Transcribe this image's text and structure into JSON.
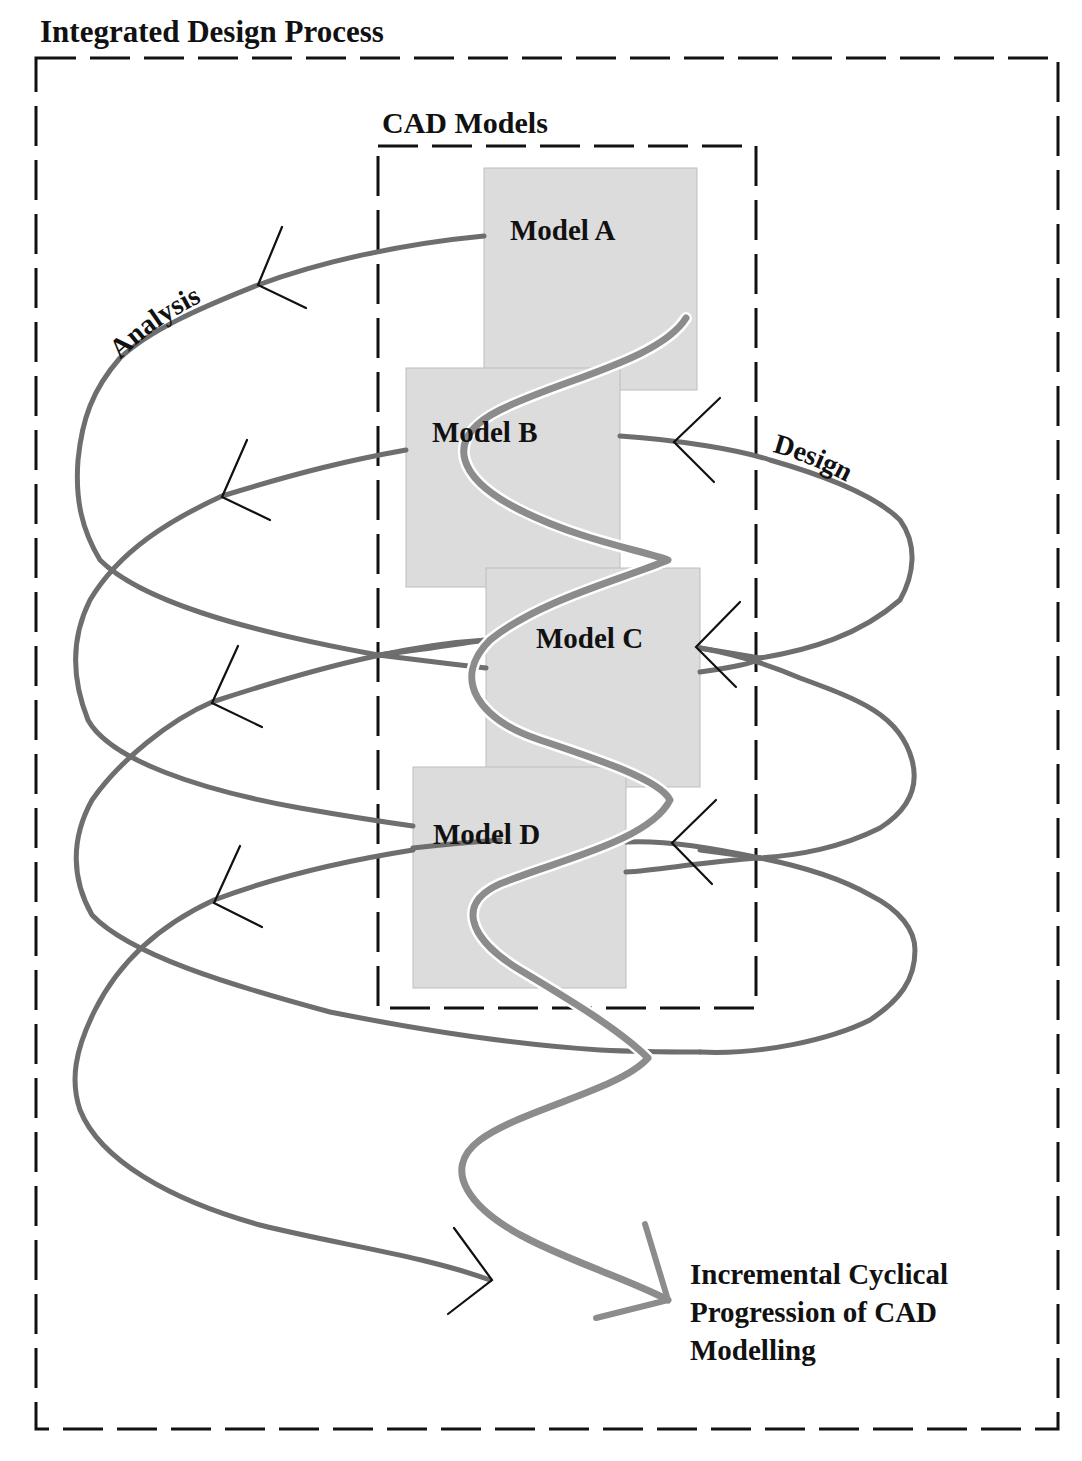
{
  "diagram": {
    "outer_frame": {
      "title": "Integrated Design Process",
      "style": "dashed"
    },
    "inner_frame": {
      "title": "CAD Models",
      "style": "dashed"
    },
    "models": [
      {
        "id": "A",
        "label": "Model A"
      },
      {
        "id": "B",
        "label": "Model B"
      },
      {
        "id": "C",
        "label": "Model C"
      },
      {
        "id": "D",
        "label": "Model D"
      }
    ],
    "spiral_labels": {
      "left": "Analysis",
      "right": "Design"
    },
    "caption": {
      "lines": [
        "Incremental Cyclical",
        "Progression of CAD",
        "Modelling"
      ]
    },
    "colors": {
      "frame": "#111111",
      "spiral": "#6e6e6e",
      "model_fill": "#dcdcdc",
      "wave": "#8c8c8c",
      "arrowhead": "#111111"
    }
  }
}
